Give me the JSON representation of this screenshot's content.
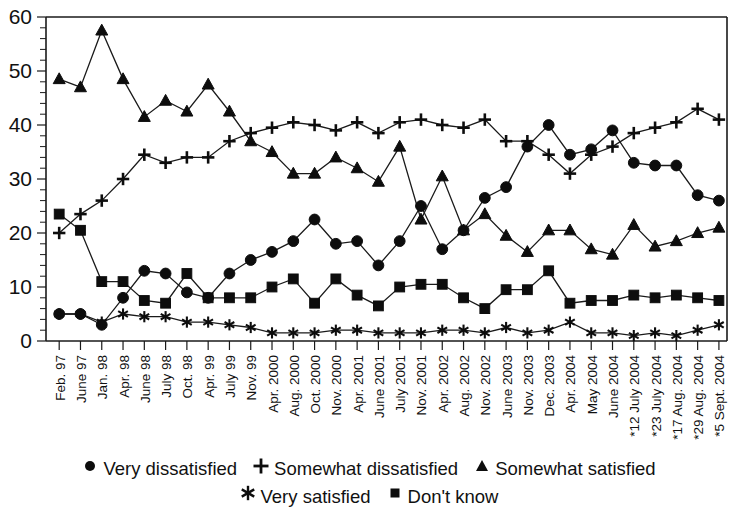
{
  "chart_data": {
    "type": "line",
    "title": "",
    "subtitle": "",
    "xlabel": "",
    "ylabel": "",
    "ylim": [
      0,
      60
    ],
    "ytick_step": 10,
    "yminor_step": 2,
    "yticks": [
      0,
      10,
      20,
      30,
      40,
      50,
      60
    ],
    "grid": false,
    "legend_position": "bottom",
    "categories": [
      "Feb. 97",
      "June 97",
      "Jan. 98",
      "Apr. 98",
      "June 98",
      "July 98",
      "Oct. 98",
      "Apr. 99",
      "July 99",
      "Nov. 99",
      "Apr. 2000",
      "Aug. 2000",
      "Oct. 2000",
      "Nov. 2000",
      "Apr. 2001",
      "June 2001",
      "July 2001",
      "Nov. 2001",
      "Apr. 2002",
      "Aug. 2002",
      "Nov. 2002",
      "June 2003",
      "Nov. 2003",
      "Dec. 2003",
      "Apr. 2004",
      "May 2004",
      "June 2004",
      "*12 July 2004",
      "*23 July 2004",
      "*17 Aug. 2004",
      "*29 Aug. 2004",
      "*5 Sept. 2004"
    ],
    "series": [
      {
        "name": "Very dissatisfied",
        "marker": "circle",
        "values": [
          5,
          5,
          3,
          8,
          13,
          12.5,
          9,
          8,
          12.5,
          15,
          16.5,
          18.5,
          22.5,
          18,
          18.5,
          14,
          18.5,
          25,
          17,
          20.5,
          26.5,
          28.5,
          36,
          40,
          34.5,
          35.5,
          39,
          33,
          32.5,
          32.5,
          27,
          26
        ]
      },
      {
        "name": "Somewhat dissatisfied",
        "marker": "plus",
        "values": [
          20,
          23.5,
          26,
          30,
          34.5,
          33,
          34,
          34,
          37,
          38.5,
          39.5,
          40.5,
          40,
          39,
          40.5,
          38.5,
          40.5,
          41,
          40,
          39.5,
          41,
          37,
          37,
          34.5,
          31,
          34.5,
          36,
          38.5,
          39.5,
          40.5,
          43,
          41
        ]
      },
      {
        "name": "Somewhat satisfied",
        "marker": "triangle",
        "values": [
          48.5,
          47,
          57.5,
          48.5,
          41.5,
          44.5,
          42.5,
          47.5,
          42.5,
          37,
          35,
          31,
          31,
          34,
          32,
          29.5,
          36,
          22.5,
          30.5,
          20.5,
          23.5,
          19.5,
          16.5,
          20.5,
          20.5,
          17,
          16,
          21.5,
          17.5,
          18.5,
          20,
          21
        ]
      },
      {
        "name": "Very satisfied",
        "marker": "star",
        "values": [
          5,
          5,
          3.5,
          5,
          4.5,
          4.5,
          3.5,
          3.5,
          3,
          2.5,
          1.5,
          1.5,
          1.5,
          2,
          2,
          1.5,
          1.5,
          1.5,
          2,
          2,
          1.5,
          2.5,
          1.5,
          2,
          3.5,
          1.5,
          1.5,
          1,
          1.5,
          1,
          2,
          3
        ]
      },
      {
        "name": "Don't know",
        "marker": "square",
        "values": [
          23.5,
          20.5,
          11,
          11,
          7.5,
          7,
          12.5,
          8,
          8,
          8,
          10,
          11.5,
          7,
          11.5,
          8.5,
          6.5,
          10,
          10.5,
          10.5,
          8,
          6,
          9.5,
          9.5,
          13,
          7,
          7.5,
          7.5,
          8.5,
          8,
          8.5,
          8,
          7.5
        ]
      }
    ]
  },
  "legend": {
    "rows": [
      [
        {
          "marker": "circle",
          "label": "Very dissatisfied"
        },
        {
          "marker": "plus",
          "label": "Somewhat dissatisfied"
        },
        {
          "marker": "triangle",
          "label": "Somewhat satisfied"
        }
      ],
      [
        {
          "marker": "star",
          "label": "Very satisfied"
        },
        {
          "marker": "square",
          "label": "Don't know"
        }
      ]
    ]
  }
}
